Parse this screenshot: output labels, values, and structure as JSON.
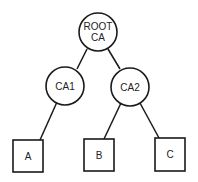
{
  "diagram": {
    "type": "tree",
    "nodes": [
      {
        "id": "root",
        "shape": "circle",
        "label_lines": [
          "ROOT",
          "CA"
        ]
      },
      {
        "id": "ca1",
        "shape": "circle",
        "label": "CA1"
      },
      {
        "id": "ca2",
        "shape": "circle",
        "label": "CA2"
      },
      {
        "id": "a",
        "shape": "square",
        "label": "A"
      },
      {
        "id": "b",
        "shape": "square",
        "label": "B"
      },
      {
        "id": "c",
        "shape": "square",
        "label": "C"
      }
    ],
    "edges": [
      {
        "from": "root",
        "to": "ca1"
      },
      {
        "from": "root",
        "to": "ca2"
      },
      {
        "from": "ca1",
        "to": "a"
      },
      {
        "from": "ca2",
        "to": "b"
      },
      {
        "from": "ca2",
        "to": "c"
      }
    ],
    "labels": {
      "root_line1": "ROOT",
      "root_line2": "CA",
      "ca1": "CA1",
      "ca2": "CA2",
      "a": "A",
      "b": "B",
      "c": "C"
    }
  }
}
